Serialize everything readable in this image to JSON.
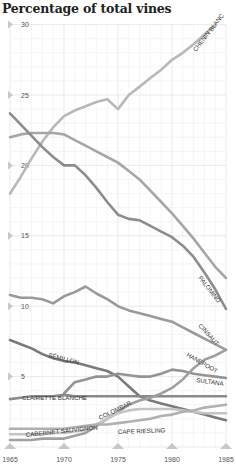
{
  "title": "Percentage of total vines",
  "chart_data": {
    "type": "line",
    "title": "Percentage of total vines",
    "xlabel": "",
    "ylabel": "Percentage of total vines",
    "x": [
      1965,
      1966,
      1967,
      1968,
      1969,
      1970,
      1971,
      1972,
      1973,
      1974,
      1975,
      1976,
      1977,
      1978,
      1979,
      1980,
      1981,
      1982,
      1983,
      1984,
      1985
    ],
    "x_ticks": [
      "1965",
      "1970",
      "1975",
      "1980",
      "1985"
    ],
    "y_ticks": [
      "5",
      "10",
      "15",
      "20",
      "25",
      "30"
    ],
    "ylim": [
      0,
      30
    ],
    "xlim": [
      1965,
      1985
    ],
    "grid": true,
    "series": [
      {
        "name": "CHENIN BLANC",
        "color": "#b8b8b8",
        "values": [
          18.0,
          19.2,
          20.5,
          21.7,
          22.7,
          23.5,
          23.9,
          24.2,
          24.5,
          24.7,
          24.0,
          25.0,
          25.6,
          26.2,
          26.8,
          27.5,
          28.0,
          28.6,
          29.3,
          30.0,
          null
        ]
      },
      {
        "name": "PALOMINO",
        "color": "#a6a6a6",
        "values": [
          22.0,
          22.2,
          22.3,
          22.3,
          22.3,
          22.2,
          21.8,
          21.4,
          21.0,
          20.6,
          20.2,
          19.6,
          19.0,
          18.2,
          17.4,
          16.6,
          15.7,
          14.8,
          13.8,
          12.8,
          12.0
        ]
      },
      {
        "name": "CINSAUT",
        "color": "#8c8c8c",
        "values": [
          23.7,
          22.9,
          22.1,
          21.3,
          20.6,
          20.0,
          20.0,
          19.3,
          18.4,
          17.4,
          16.5,
          16.2,
          16.1,
          15.7,
          15.3,
          14.9,
          14.3,
          13.5,
          12.4,
          11.2,
          9.8
        ]
      },
      {
        "name": "HANEPOOT",
        "color": "#9a9a9a",
        "values": [
          10.8,
          10.6,
          10.6,
          10.5,
          10.2,
          10.7,
          11.0,
          11.4,
          10.9,
          10.5,
          10.0,
          9.7,
          9.5,
          9.3,
          9.1,
          8.9,
          8.5,
          8.1,
          7.7,
          7.3,
          6.9
        ]
      },
      {
        "name": "SÉMILLON",
        "color": "#7a7a7a",
        "values": [
          7.6,
          7.3,
          7.0,
          6.6,
          6.3,
          6.1,
          6.0,
          5.8,
          5.6,
          5.4,
          5.0,
          4.3,
          3.6,
          3.3,
          3.1,
          2.9,
          2.7,
          2.5,
          2.3,
          2.1,
          1.9
        ]
      },
      {
        "name": "SULTANA",
        "color": "#949494",
        "values": [
          null,
          null,
          null,
          null,
          null,
          3.8,
          4.6,
          4.8,
          5.0,
          5.0,
          5.2,
          5.1,
          5.0,
          5.0,
          5.2,
          5.5,
          5.4,
          5.2,
          5.1,
          5.0,
          4.9
        ]
      },
      {
        "name": "CLAIRETTE BLANCHE",
        "color": "#8a8a8a",
        "values": [
          3.4,
          3.5,
          3.6,
          3.6,
          3.6,
          3.7,
          3.6,
          3.6,
          3.6,
          3.6,
          3.6,
          3.6,
          3.6,
          3.6,
          3.6,
          3.6,
          3.6,
          3.6,
          3.6,
          3.6,
          3.6
        ]
      },
      {
        "name": "COLOMBAR",
        "color": "#a0a0a0",
        "values": [
          0.5,
          0.5,
          0.5,
          0.6,
          0.6,
          0.6,
          0.8,
          1.0,
          1.5,
          2.0,
          2.5,
          3.0,
          3.3,
          3.5,
          3.8,
          4.2,
          4.8,
          5.6,
          6.2,
          6.5,
          6.9
        ]
      },
      {
        "name": "CABERNET SAUVIGNON",
        "color": "#c4c4c4",
        "values": [
          0.9,
          0.9,
          0.9,
          0.9,
          1.0,
          1.0,
          1.1,
          1.2,
          1.6,
          2.0,
          2.4,
          2.6,
          2.7,
          2.7,
          2.7,
          2.7,
          2.6,
          2.5,
          2.4,
          2.4,
          2.4
        ]
      },
      {
        "name": "CAPE RIESLING",
        "color": "#b0b0b0",
        "values": [
          1.3,
          1.3,
          1.3,
          1.3,
          1.3,
          1.3,
          1.4,
          1.5,
          1.6,
          1.6,
          1.7,
          1.8,
          1.9,
          2.0,
          2.2,
          2.3,
          2.5,
          2.6,
          2.8,
          2.9,
          3.0
        ]
      }
    ],
    "annotations": [
      "CHENIN BLANC",
      "PALOMINO",
      "CINSAUT",
      "HANEPOOT",
      "SÉMILLON",
      "SULTANA",
      "CLAIRETTE BLANCHE",
      "CABERNET SAUVIGNON",
      "COLOMBAR",
      "CAPE RIESLING"
    ],
    "legend": "inline labels"
  }
}
